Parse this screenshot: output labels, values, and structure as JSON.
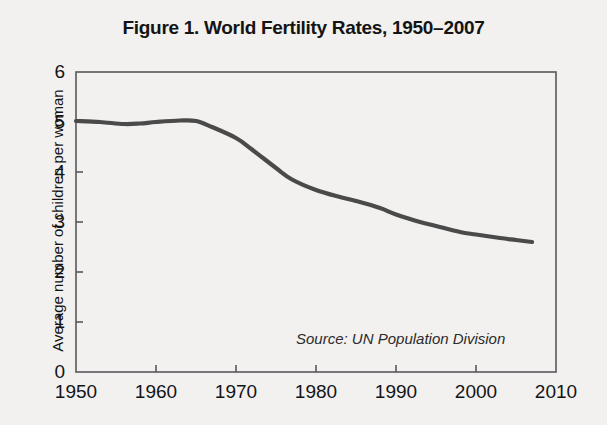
{
  "figure": {
    "title": "Figure 1. World Fertility Rates, 1950–2007",
    "source_note": "Source: UN Population Division"
  },
  "chart_data": {
    "type": "line",
    "title": "Figure 1. World Fertility Rates, 1950–2007",
    "xlabel": "",
    "ylabel": "Average number of children per woman",
    "xlim": [
      1950,
      2010
    ],
    "ylim": [
      0,
      6
    ],
    "grid": false,
    "legend": null,
    "line_color": "#4a4a4a",
    "axis_color": "#58585a",
    "background_color": "#f2f1ef",
    "annotations": [
      "Source: UN Population Division"
    ],
    "x_ticks": [
      1950,
      1960,
      1970,
      1980,
      1990,
      2000,
      2010
    ],
    "x_tick_labels": [
      "1950",
      "1960",
      "1970",
      "1980",
      "1990",
      "2000",
      "2010"
    ],
    "y_ticks": [
      0,
      1,
      2,
      3,
      4,
      5,
      6
    ],
    "y_tick_labels": [
      "0",
      "1",
      "2",
      "3",
      "4",
      "5",
      "6"
    ],
    "series": [
      {
        "name": "World total fertility rate",
        "x": [
          1950,
          1953,
          1956,
          1958,
          1960,
          1963,
          1965,
          1967,
          1970,
          1972,
          1975,
          1977,
          1980,
          1983,
          1985,
          1988,
          1990,
          1993,
          1995,
          1998,
          2000,
          2003,
          2005,
          2007
        ],
        "values": [
          5.02,
          5.0,
          4.96,
          4.97,
          5.0,
          5.03,
          5.02,
          4.9,
          4.68,
          4.45,
          4.08,
          3.85,
          3.64,
          3.5,
          3.42,
          3.28,
          3.15,
          3.0,
          2.92,
          2.8,
          2.75,
          2.68,
          2.64,
          2.6
        ]
      }
    ]
  },
  "axes_geometry": {
    "plot_left_px": 76,
    "plot_right_px": 556,
    "plot_top_px": 72,
    "plot_bottom_px": 372
  }
}
